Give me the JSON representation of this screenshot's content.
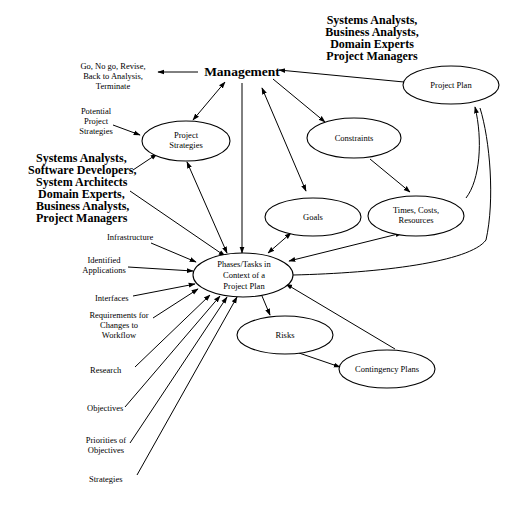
{
  "diagram": {
    "type": "flow-diagram",
    "nodes": {
      "management": {
        "label": "Management"
      },
      "project_strategies": {
        "line1": "Project",
        "line2": "Strategies"
      },
      "constraints": {
        "label": "Constraints"
      },
      "goals": {
        "label": "Goals"
      },
      "times_costs": {
        "line1": "Times, Costs,",
        "line2": "Resources"
      },
      "project_plan": {
        "label": "Project Plan"
      },
      "phases": {
        "line1": "Phases/Tasks  in",
        "line2": "Context of a",
        "line3": "Project Plan"
      },
      "risks": {
        "label": "Risks"
      },
      "contingency": {
        "label": "Contingency Plans"
      }
    },
    "labels": {
      "decisions": {
        "line1": "Go, No go, Revise,",
        "line2": "Back to Analysis,",
        "line3": "Terminate"
      },
      "potential_strategies": {
        "line1": "Potential",
        "line2": "Project",
        "line3": "Strategies"
      },
      "roles_top": {
        "line1": "Systems Analysts,",
        "line2": "Business Analysts,",
        "line3": "Domain Experts",
        "line4": "Project Managers"
      },
      "roles_left": {
        "line1": "Systems Analysts,",
        "line2": "Software Developers,",
        "line3": "System Architects",
        "line4": "Domain Experts,",
        "line5": "Business Analysts,",
        "line6": "Project Managers"
      },
      "infrastructure": "Infrastructure",
      "identified_apps": {
        "line1": "Identified",
        "line2": "Applications"
      },
      "interfaces": "Interfaces",
      "requirements": {
        "line1": "Requirements for",
        "line2": "Changes to",
        "line3": "Workflow"
      },
      "research": "Research",
      "objectives": "Objectives",
      "priorities": {
        "line1": "Priorities of",
        "line2": "Objectives"
      },
      "strategies": "Strategies"
    },
    "edges": [
      {
        "from": "Management",
        "to": "Go, No go, Revise, Back to Analysis, Terminate"
      },
      {
        "from": "Management",
        "to": "Project Strategies",
        "bidirectional": true
      },
      {
        "from": "Management",
        "to": "Phases/Tasks in Context of a Project Plan"
      },
      {
        "from": "Management",
        "to": "Constraints"
      },
      {
        "from": "Management",
        "to": "Goals",
        "bidirectional": true
      },
      {
        "from": "Project Plan",
        "to": "Management"
      },
      {
        "from": "Potential Project Strategies",
        "to": "Project Strategies"
      },
      {
        "from": "Systems Analysts (left group)",
        "to": "Project Strategies"
      },
      {
        "from": "Systems Analysts (left group)",
        "to": "Phases/Tasks in Context of a Project Plan"
      },
      {
        "from": "Project Strategies",
        "to": "Phases/Tasks in Context of a Project Plan",
        "bidirectional": true
      },
      {
        "from": "Constraints",
        "to": "Times, Costs, Resources"
      },
      {
        "from": "Times, Costs, Resources",
        "to": "Project Plan"
      },
      {
        "from": "Goals",
        "to": "Phases/Tasks in Context of a Project Plan",
        "bidirectional": true
      },
      {
        "from": "Times, Costs, Resources",
        "to": "Phases/Tasks in Context of a Project Plan",
        "bidirectional": true
      },
      {
        "from": "Phases/Tasks in Context of a Project Plan",
        "to": "Project Plan"
      },
      {
        "from": "Contingency Plans",
        "to": "Phases/Tasks in Context of a Project Plan"
      },
      {
        "from": "Phases/Tasks in Context of a Project Plan",
        "to": "Risks"
      },
      {
        "from": "Risks",
        "to": "Contingency Plans"
      },
      {
        "from": "Infrastructure",
        "to": "Phases/Tasks in Context of a Project Plan"
      },
      {
        "from": "Identified Applications",
        "to": "Phases/Tasks in Context of a Project Plan"
      },
      {
        "from": "Interfaces",
        "to": "Phases/Tasks in Context of a Project Plan"
      },
      {
        "from": "Requirements for Changes to Workflow",
        "to": "Phases/Tasks in Context of a Project Plan"
      },
      {
        "from": "Research",
        "to": "Phases/Tasks in Context of a Project Plan"
      },
      {
        "from": "Objectives",
        "to": "Phases/Tasks in Context of a Project Plan"
      },
      {
        "from": "Priorities of Objectives",
        "to": "Phases/Tasks in Context of a Project Plan"
      },
      {
        "from": "Strategies",
        "to": "Phases/Tasks in Context of a Project Plan"
      }
    ],
    "colors": {
      "line": "#000000",
      "background": "#ffffff",
      "node_fill": "#ffffff"
    }
  }
}
